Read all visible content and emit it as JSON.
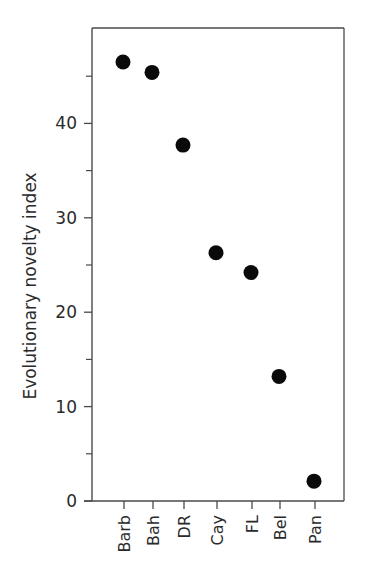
{
  "chart_data": {
    "type": "scatter",
    "title": "",
    "xlabel": "",
    "ylabel": "Evolutionary novelty index",
    "categories": [
      "Barb",
      "Bah",
      "DR",
      "Cay",
      "FL",
      "Bel",
      "Pan"
    ],
    "values": [
      46.5,
      45.4,
      37.7,
      26.3,
      24.2,
      13.2,
      2.1
    ],
    "ylim": [
      0,
      50
    ],
    "y_major_ticks": [
      0,
      10,
      20,
      30,
      40
    ],
    "y_minor_ticks": [
      5,
      15,
      25,
      35,
      45
    ],
    "grid": false,
    "legend": null,
    "marker_color": "#0a0a0a",
    "frame": "box"
  }
}
